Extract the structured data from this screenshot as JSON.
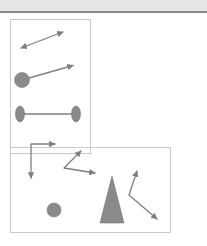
{
  "canvas": {
    "width": 207,
    "height": 246,
    "background": "#ffffff"
  },
  "header": {
    "band_color": "#e6e6e6",
    "rule_color": "#8a8a8a",
    "band_height": 11
  },
  "palette": {
    "panel_border": "#c9c9c9",
    "stroke": "#7f7f7f",
    "shape_fill": "#8a8a8a",
    "shape_stroke": "#777777"
  },
  "panels": [
    {
      "name": "upper-left-panel",
      "x": 10,
      "y": 6,
      "width": 80,
      "height": 134
    },
    {
      "name": "lower-right-panel",
      "x": 10,
      "y": 134,
      "width": 160,
      "height": 85
    }
  ],
  "shapes": [
    {
      "name": "double-headed-arrow",
      "type": "double-arrow",
      "points": "21,35 63,19",
      "arrowheads": [
        "start",
        "end"
      ]
    },
    {
      "name": "circle-with-arrow",
      "type": "circle-arrow",
      "circle": {
        "cx": 22,
        "cy": 67,
        "rx": 7.5,
        "ry": 7.5
      },
      "line": "29,65 75,52",
      "arrowheads": [
        "end"
      ]
    },
    {
      "name": "dumbbell",
      "type": "dumbbell",
      "left_ellipse": {
        "cx": 20,
        "cy": 101,
        "rx": 4.5,
        "ry": 8
      },
      "right_ellipse": {
        "cx": 76,
        "cy": 101,
        "rx": 4.5,
        "ry": 8
      },
      "line": "20,101 76,101"
    },
    {
      "name": "elbow-arrow",
      "type": "elbow-double-arrow",
      "points": "55,131 31,131 31,167",
      "arrowheads": [
        "start",
        "end"
      ]
    },
    {
      "name": "chevron-arrow",
      "type": "chevron-double-arrow",
      "points": "82,137 64,155 97,160",
      "arrowheads": [
        "start",
        "end"
      ]
    },
    {
      "name": "small-circle",
      "type": "circle",
      "circle": {
        "cx": 54,
        "cy": 197,
        "rx": 7,
        "ry": 7
      }
    },
    {
      "name": "triangle-cone",
      "type": "triangle",
      "points": "112,163 124,210 100,210"
    },
    {
      "name": "bent-double-arrow",
      "type": "bent-double-arrow",
      "points": "137,157 129,182 159,208",
      "arrowheads": [
        "start",
        "end"
      ]
    }
  ]
}
